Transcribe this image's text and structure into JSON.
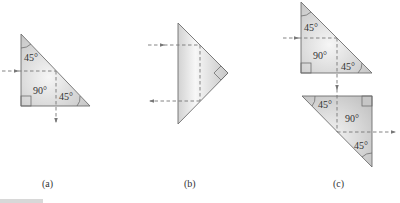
{
  "figure": {
    "panels": [
      {
        "id": "a",
        "caption": "(a)",
        "labels": {
          "top_angle": "45°",
          "right_angle": "90°",
          "bottom_angle": "45°"
        },
        "description": "45-45-90 prism; ray enters left face, reflects at hypotenuse, exits downward"
      },
      {
        "id": "b",
        "caption": "(b)",
        "description": "Prism with right angle pointing right; ray enters left face, reflects twice, exits left (retro-reflection)"
      },
      {
        "id": "c",
        "caption": "(c)",
        "upper_prism_labels": {
          "top_angle": "45°",
          "right_angle": "90°",
          "bottom_angle": "45°"
        },
        "lower_prism_labels": {
          "top_angle": "45°",
          "right_angle": "90°",
          "bottom_angle": "45°"
        },
        "description": "Two prisms; ray deflected down by upper prism then right by lower prism (periscope)"
      }
    ],
    "colors": {
      "prism_fill_center": "#f4f4f4",
      "prism_fill_edge": "#c9c9c9",
      "outline": "#6e6e6e",
      "ray": "#777777"
    }
  }
}
